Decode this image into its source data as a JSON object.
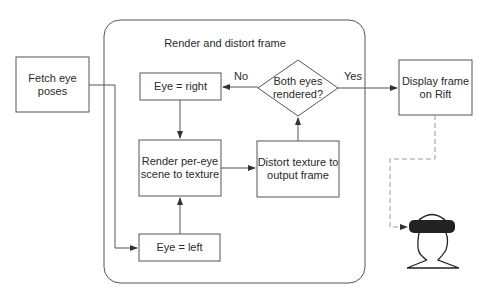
{
  "diagram": {
    "container_title": "Render and distort frame",
    "nodes": {
      "fetch": {
        "line1": "Fetch eye",
        "line2": "poses"
      },
      "eye_right": {
        "label": "Eye = right"
      },
      "decision": {
        "line1": "Both eyes",
        "line2": "rendered?"
      },
      "display": {
        "line1": "Display frame",
        "line2": "on Rift"
      },
      "render": {
        "line1": "Render per-eye",
        "line2": "scene to texture"
      },
      "distort": {
        "line1": "Distort texture to",
        "line2": "output frame"
      },
      "eye_left": {
        "label": "Eye = left"
      }
    },
    "edges": {
      "no_label": "No",
      "yes_label": "Yes"
    },
    "colors": {
      "stroke": "#555555",
      "text": "#2a2a2a",
      "dashed": "#999999",
      "headset": "#222222"
    }
  }
}
